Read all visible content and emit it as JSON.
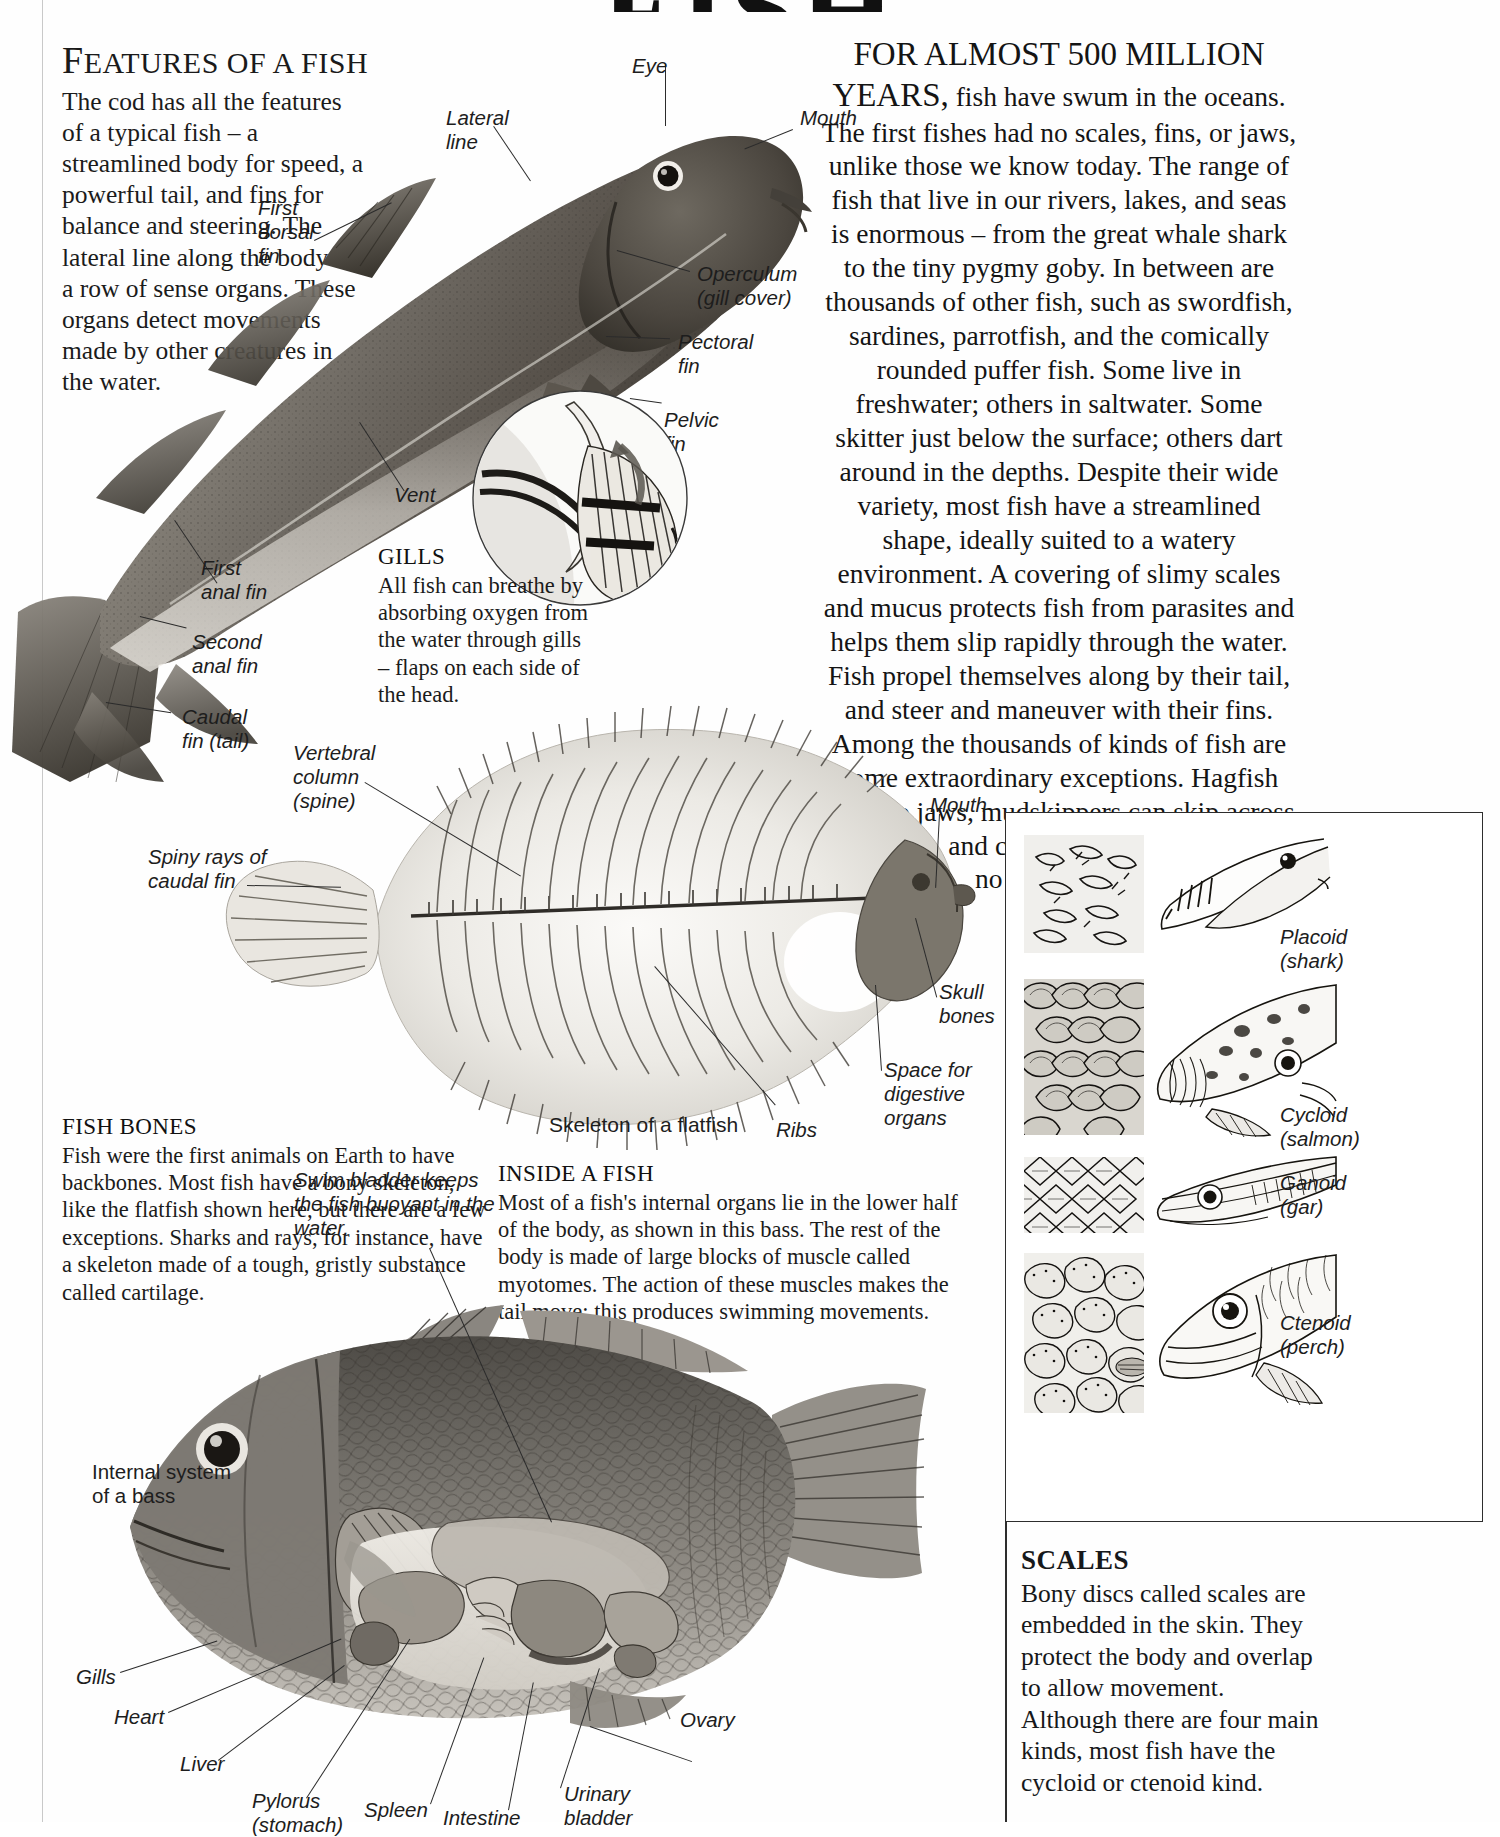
{
  "page": {
    "title": "FISH",
    "background_color": "#ffffff",
    "ink_color": "#16181a"
  },
  "features_section": {
    "heading_first_letter": "F",
    "heading_rest": "EATURES OF A FISH",
    "heading_full": "FEATURES OF A FISH",
    "body": "The cod has all the features of a typical fish – a streamlined body for speed, a powerful tail, and fins for balance and steering. The lateral line along the body is a row of sense organs. These organs detect movements made by other creatures in the water."
  },
  "cod_labels": [
    {
      "name": "eye",
      "text": "Eye"
    },
    {
      "name": "lateral-line",
      "text": "Lateral\nline"
    },
    {
      "name": "mouth",
      "text": "Mouth"
    },
    {
      "name": "first-dorsal-fin",
      "text": "First\ndorsal\nfin"
    },
    {
      "name": "operculum",
      "text": "Operculum\n(gill cover)"
    },
    {
      "name": "pectoral-fin",
      "text": "Pectoral\nfin"
    },
    {
      "name": "pelvic-fin",
      "text": "Pelvic\nfin"
    },
    {
      "name": "vent",
      "text": "Vent"
    },
    {
      "name": "first-anal-fin",
      "text": "First\nanal fin"
    },
    {
      "name": "second-anal-fin",
      "text": "Second\nanal fin"
    },
    {
      "name": "caudal-fin",
      "text": "Caudal\nfin (tail)"
    }
  ],
  "gills_section": {
    "heading": "GILLS",
    "body": "All fish can breathe by absorbing oxygen from the water through gills – flaps on each side of the head."
  },
  "intro_section": {
    "opening_small_caps": "FOR ALMOST 500 MILLION YEARS,",
    "body": "fish have swum in the oceans. The first fishes had no scales, fins, or jaws, unlike those we know today. The range of fish that live in our rivers, lakes, and seas is enormous – from the great whale shark to the tiny pygmy goby. In between are thousands of other fish, such as swordfish, sardines, parrotfish, and the comically rounded puffer fish. Some live in freshwater; others in saltwater. Some skitter just below the surface; others dart around in the depths. Despite their wide variety, most fish have a streamlined shape, ideally suited to a watery environment. A covering of slimy scales and mucus protects fish from parasites and helps them slip rapidly through the water. Fish propel themselves along by their tail, and steer and maneuver with their fins. Among the thousands of kinds of fish are some extraordinary exceptions. Hagfish have no jaws, mudskippers can skip across mud flats, and catfish can crawl and have no scales at all."
  },
  "fish_bones_section": {
    "heading": "FISH BONES",
    "body": "Fish were the first animals on Earth to have backbones. Most fish have a bony skeleton, like the flatfish shown here, but there are a few exceptions. Sharks and rays, for instance, have a skeleton made of a tough, gristly substance called cartilage."
  },
  "flatfish_labels": [
    {
      "name": "vertebral-column",
      "text": "Vertebral\ncolumn\n(spine)"
    },
    {
      "name": "spiny-rays",
      "text": "Spiny rays of\ncaudal fin"
    },
    {
      "name": "mouth",
      "text": "Mouth"
    },
    {
      "name": "skull-bones",
      "text": "Skull\nbones"
    },
    {
      "name": "space-digestive-organs",
      "text": "Space for\ndigestive\norgans"
    },
    {
      "name": "ribs",
      "text": "Ribs"
    }
  ],
  "flatfish_caption": "Skeleton of a flatfish",
  "inside_fish_section": {
    "heading": "INSIDE A FISH",
    "body": "Most of a fish's internal organs lie in the lower half of the body, as shown in this bass. The rest of the body is made of large blocks of muscle called myotomes. The action of these muscles makes the tail move; this produces  swimming movements."
  },
  "swim_bladder_note": "Swim bladder keeps\nthe fish buoyant in the\nwater.",
  "bass_caption": "Internal system\nof a bass",
  "bass_labels": [
    {
      "name": "gills",
      "text": "Gills"
    },
    {
      "name": "heart",
      "text": "Heart"
    },
    {
      "name": "liver",
      "text": "Liver"
    },
    {
      "name": "pylorus",
      "text": "Pylorus\n(stomach)"
    },
    {
      "name": "spleen",
      "text": "Spleen"
    },
    {
      "name": "intestine",
      "text": "Intestine"
    },
    {
      "name": "urinary-bladder",
      "text": "Urinary\nbladder"
    },
    {
      "name": "ovary",
      "text": "Ovary"
    }
  ],
  "scales_panel": {
    "items": [
      {
        "name": "placoid",
        "label": "Placoid\n(shark)"
      },
      {
        "name": "cycloid",
        "label": "Cycloid\n(salmon)"
      },
      {
        "name": "ganoid",
        "label": "Ganoid\n(gar)"
      },
      {
        "name": "ctenoid",
        "label": "Ctenoid\n(perch)"
      }
    ],
    "heading": "SCALES",
    "body": "Bony discs called scales are embedded in the skin. They protect the body and overlap to allow movement. Although there are four main kinds, most fish have the cycloid or ctenoid kind."
  }
}
